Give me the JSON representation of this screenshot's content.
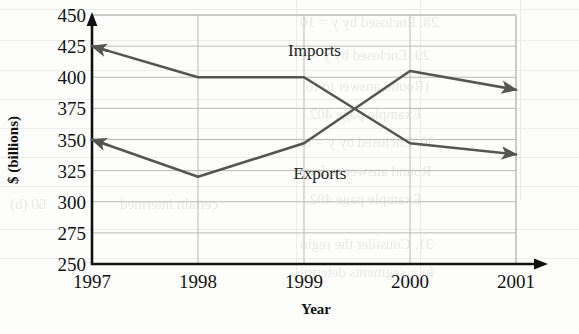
{
  "chart_data": {
    "type": "line",
    "title": "",
    "xlabel": "Year",
    "ylabel": "$ (billions)",
    "x": [
      1997,
      1998,
      1999,
      2000,
      2001
    ],
    "xtick_labels": [
      "1997",
      "1998",
      "1999",
      "2000",
      "2001"
    ],
    "xlim": [
      1997,
      2001
    ],
    "ylim": [
      250,
      450
    ],
    "ytick_labels": [
      "450",
      "425",
      "400",
      "375",
      "350",
      "325",
      "300",
      "275",
      "250"
    ],
    "ytick_values": [
      450,
      425,
      400,
      375,
      350,
      325,
      300,
      275,
      250
    ],
    "grid": true,
    "grid_axis": "both",
    "legend_position": "inline-annotation",
    "series": [
      {
        "name": "Imports",
        "label": "Imports",
        "color": "#555555",
        "values": [
          425,
          400,
          400,
          347,
          338
        ],
        "arrow_start": true,
        "arrow_end": true
      },
      {
        "name": "Exports",
        "label": "Exports",
        "color": "#555555",
        "values": [
          350,
          320,
          347,
          405,
          390
        ],
        "arrow_start": true,
        "arrow_end": true
      }
    ],
    "annotations": [
      {
        "text": "Imports",
        "x": 1998.85,
        "y": 417
      },
      {
        "text": "Exports",
        "x": 1998.9,
        "y": 318
      }
    ]
  },
  "background_bleed": {
    "note": "faint mirrored text showing through from the reverse of the scanned page",
    "rows": [
      {
        "text": "28. Enclosed by  y = 10",
        "x": 300,
        "y": 14,
        "size": 15
      },
      {
        "text": "29.  Enclosed by  y = e",
        "x": 300,
        "y": 47,
        "size": 15
      },
      {
        "text": "(Round answer to fo",
        "x": 306,
        "y": 78,
        "size": 15
      },
      {
        "text": "Example page 402.",
        "x": 306,
        "y": 106,
        "size": 15
      },
      {
        "text": "30. Enclosed by  y = ln",
        "x": 300,
        "y": 134,
        "size": 15
      },
      {
        "text": "Round answer to fou",
        "x": 306,
        "y": 163,
        "size": 15
      },
      {
        "text": "Example page 402.",
        "x": 306,
        "y": 191,
        "size": 15
      },
      {
        "text": "31. Consider the regio",
        "x": 300,
        "y": 236,
        "size": 15
      },
      {
        "text": "four segments determi",
        "x": 300,
        "y": 264,
        "size": 15
      },
      {
        "text": "certain intermed",
        "x": 120,
        "y": 196,
        "size": 15
      },
      {
        "text": "60 (b)",
        "x": 10,
        "y": 196,
        "size": 15
      }
    ]
  }
}
